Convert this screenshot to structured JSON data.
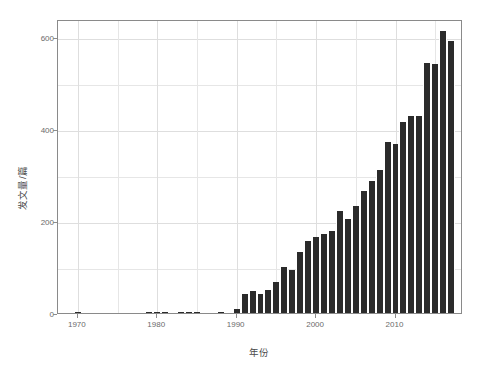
{
  "chart_data": {
    "type": "bar",
    "title": "",
    "subtitle": "",
    "xlabel": "年份",
    "ylabel": "发文量/篇",
    "categories": [
      1970,
      1971,
      1972,
      1973,
      1974,
      1975,
      1976,
      1977,
      1978,
      1979,
      1980,
      1981,
      1982,
      1983,
      1984,
      1985,
      1986,
      1987,
      1988,
      1989,
      1990,
      1991,
      1992,
      1993,
      1994,
      1995,
      1996,
      1997,
      1998,
      1999,
      2000,
      2001,
      2002,
      2003,
      2004,
      2005,
      2006,
      2007,
      2008,
      2009,
      2010,
      2011,
      2012,
      2013,
      2014,
      2015,
      2016,
      2017
    ],
    "values": [
      1,
      0,
      0,
      0,
      0,
      0,
      0,
      0,
      0,
      1,
      2,
      1,
      0,
      1,
      1,
      1,
      0,
      0,
      1,
      0,
      9,
      41,
      47,
      42,
      51,
      68,
      101,
      93,
      132,
      156,
      166,
      172,
      178,
      221,
      204,
      232,
      265,
      288,
      312,
      373,
      369,
      415,
      428,
      429,
      544,
      543,
      613,
      593
    ],
    "xticks": [
      1970,
      1980,
      1990,
      2000,
      2010
    ],
    "xtick_labels": [
      "1970",
      "1980",
      "1990",
      "2000",
      "2010"
    ],
    "yticks": [
      0,
      200,
      400,
      600
    ],
    "ytick_labels": [
      "0",
      "200",
      "400",
      "600"
    ],
    "xlim": [
      1967.5,
      2018.5
    ],
    "ylim": [
      0,
      640
    ],
    "grid": true,
    "legend": "none",
    "bar_color": "#2b2b2b",
    "panel_border_color": "#8a8a8a",
    "grid_color": "#e6e6e6",
    "background": "#ffffff",
    "annotations": []
  }
}
